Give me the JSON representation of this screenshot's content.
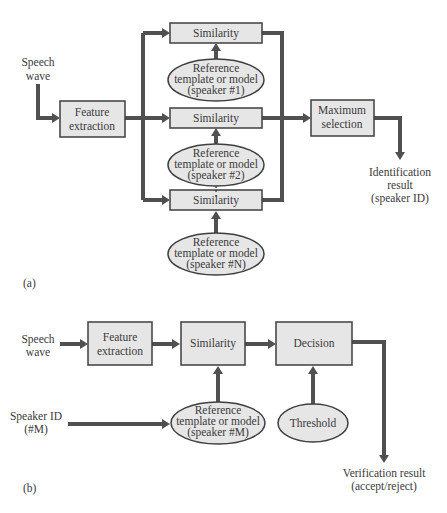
{
  "diagram_a": {
    "panel_label": "(a)",
    "input": [
      "Speech",
      "wave"
    ],
    "feature_extraction": [
      "Feature",
      "extraction"
    ],
    "similarity": [
      "Similarity",
      "Similarity",
      "Similarity"
    ],
    "references": [
      [
        "Reference",
        "template or model",
        "(speaker #1)"
      ],
      [
        "Reference",
        "template or model",
        "(speaker #2)"
      ],
      [
        "Reference",
        "template or model",
        "(speaker #N)"
      ]
    ],
    "ellipsis": "⋮",
    "max_selection": [
      "Maximum",
      "selection"
    ],
    "output": [
      "Identification",
      "result",
      "(speaker ID)"
    ]
  },
  "diagram_b": {
    "panel_label": "(b)",
    "input": [
      "Speech",
      "wave"
    ],
    "feature_extraction": [
      "Feature",
      "extraction"
    ],
    "similarity": "Similarity",
    "decision": "Decision",
    "speaker_id": [
      "Speaker ID",
      "(#M)"
    ],
    "reference": [
      "Reference",
      "template or model",
      "(speaker #M)"
    ],
    "threshold": "Threshold",
    "output": [
      "Verification result",
      "(accept/reject)"
    ]
  },
  "colors": {
    "box_fill": "#e6e6e6",
    "stroke": "#3f3f3f",
    "arrow": "#505050"
  }
}
